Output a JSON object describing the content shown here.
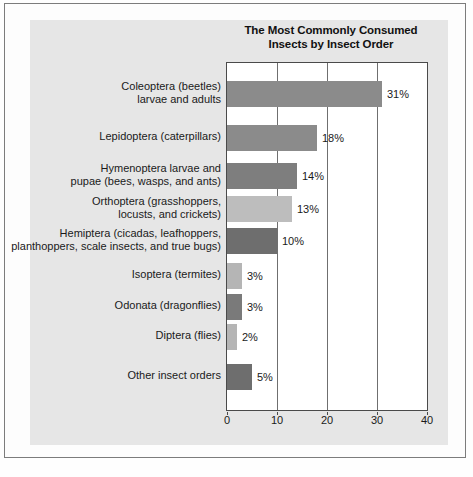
{
  "chart_data": {
    "type": "bar",
    "orientation": "horizontal",
    "title": "The Most Commonly Consumed Insects by Insect Order",
    "title_line1": "The Most Commonly Consumed",
    "title_line2": "Insects by Insect Order",
    "xlabel": "",
    "ylabel": "",
    "xlim": [
      0,
      40
    ],
    "xticks": [
      0,
      10,
      20,
      30,
      40
    ],
    "xtick_labels": [
      "0",
      "10",
      "20",
      "30",
      "40"
    ],
    "grid": true,
    "legend": false,
    "categories": [
      "Coleoptera (beetles) larvae and adults",
      "Lepidoptera (caterpillars)",
      "Hymenoptera larvae and pupae (bees, wasps, and ants)",
      "Orthoptera (grasshoppers, locusts, and crickets)",
      "Hemiptera (cicadas, leafhoppers, planthoppers, scale insects, and true bugs)",
      "Isoptera (termites)",
      "Odonata (dragonflies)",
      "Diptera (flies)",
      "Other insect orders"
    ],
    "values": [
      31,
      18,
      14,
      13,
      10,
      3,
      3,
      2,
      5
    ],
    "value_labels": [
      "31%",
      "18%",
      "14%",
      "13%",
      "10%",
      "3%",
      "3%",
      "2%",
      "5%"
    ]
  },
  "bars": [
    {
      "label_line1": "Coleoptera (beetles)",
      "label_line2": "larvae and adults",
      "value": 31,
      "value_label": "31%",
      "color": "#8b8b8b",
      "top": 18
    },
    {
      "label_line1": "Lepidoptera (caterpillars)",
      "label_line2": "",
      "value": 18,
      "value_label": "18%",
      "color": "#8b8b8b",
      "top": 62
    },
    {
      "label_line1": "Hymenoptera larvae and",
      "label_line2": "pupae (bees, wasps, and ants)",
      "value": 14,
      "value_label": "14%",
      "color": "#7e7e7e",
      "top": 100
    },
    {
      "label_line1": "Orthoptera (grasshoppers,",
      "label_line2": "locusts, and crickets)",
      "value": 13,
      "value_label": "13%",
      "color": "#bdbdbd",
      "top": 133
    },
    {
      "label_line1": "Hemiptera (cicadas, leafhoppers,",
      "label_line2": "planthoppers, scale insects, and true bugs)",
      "value": 10,
      "value_label": "10%",
      "color": "#6e6e6e",
      "top": 165
    },
    {
      "label_line1": "Isoptera (termites)",
      "label_line2": "",
      "value": 3,
      "value_label": "3%",
      "color": "#b5b5b5",
      "top": 200
    },
    {
      "label_line1": "Odonata (dragonflies)",
      "label_line2": "",
      "value": 3,
      "value_label": "3%",
      "color": "#7a7a7a",
      "top": 231
    },
    {
      "label_line1": "Diptera (flies)",
      "label_line2": "",
      "value": 2,
      "value_label": "2%",
      "color": "#b5b5b5",
      "top": 261
    },
    {
      "label_line1": "Other insect orders",
      "label_line2": "",
      "value": 5,
      "value_label": "5%",
      "color": "#6e6e6e",
      "top": 301
    }
  ],
  "axis": {
    "max": 40,
    "ticks": [
      "0",
      "10",
      "20",
      "30",
      "40"
    ]
  },
  "colors": {
    "page_background": "#fefefe",
    "panel_background": "#e6e6e6",
    "plot_background": "#ffffff",
    "frame_border": "#7c7c7c",
    "axis_line": "#4a4a4a",
    "gridline": "#6f6f6f",
    "text": "#1a1a1a"
  }
}
